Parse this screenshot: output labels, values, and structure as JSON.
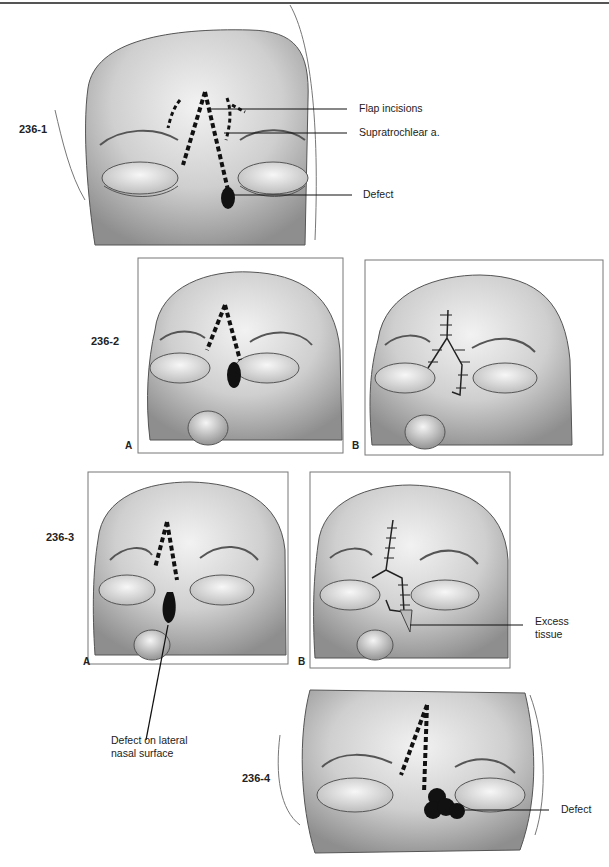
{
  "page": {
    "type": "surgical illustration plate"
  },
  "figures": [
    {
      "id": "236-1",
      "label": "236-1",
      "annotations": [
        {
          "text": "Flap incisions"
        },
        {
          "text": "Supratrochlear a."
        },
        {
          "text": "Defect"
        }
      ]
    },
    {
      "id": "236-2",
      "label": "236-2",
      "panels": [
        {
          "label": "A"
        },
        {
          "label": "B"
        }
      ]
    },
    {
      "id": "236-3",
      "label": "236-3",
      "panels": [
        {
          "label": "A"
        },
        {
          "label": "B"
        }
      ],
      "annotations": [
        {
          "text": "Excess tissue",
          "line1": "Excess",
          "line2": "tissue"
        },
        {
          "text": "Defect on lateral nasal surface",
          "line1": "Defect on lateral",
          "line2": "nasal surface"
        }
      ]
    },
    {
      "id": "236-4",
      "label": "236-4",
      "annotations": [
        {
          "text": "Defect"
        }
      ]
    }
  ],
  "colors": {
    "ink": "#111111",
    "skin_light": "#eeeeee",
    "skin_mid": "#c9c9c9",
    "skin_dark": "#8a8a8a"
  }
}
